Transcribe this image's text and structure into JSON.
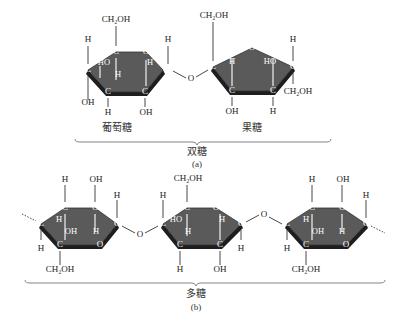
{
  "figure_a": {
    "glucose_label": "葡萄糖",
    "fructose_label": "果糖",
    "group_label": "双糖",
    "sub_label": "(a)",
    "atoms": {
      "ch2oh": "CH₂OH",
      "oh": "OH",
      "ho": "HO",
      "h": "H",
      "c": "C",
      "o": "O"
    }
  },
  "figure_b": {
    "group_label": "多糖",
    "sub_label": "(b)"
  },
  "colors": {
    "ring_fill": "#5a5a5a",
    "ring_edge": "#1e1e1e",
    "text": "#222222",
    "background": "#ffffff"
  }
}
